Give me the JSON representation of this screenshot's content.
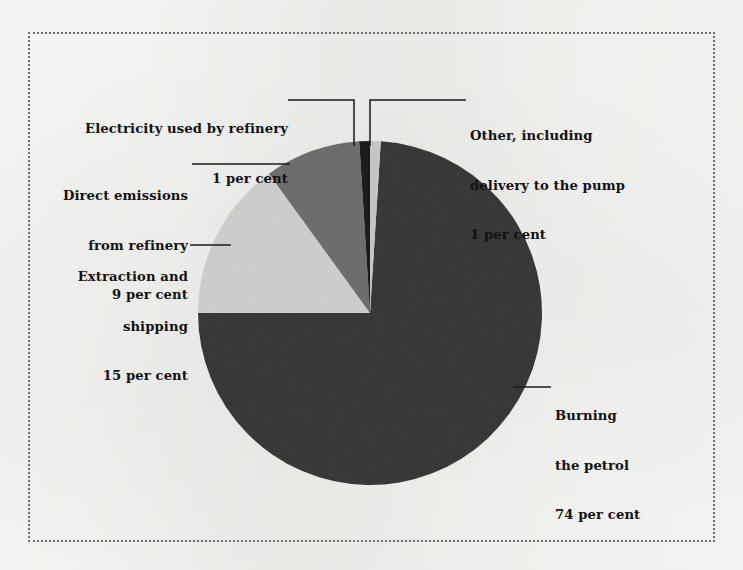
{
  "figure": {
    "frame_style": "dotted-border",
    "background_color": "#f7f7f5"
  },
  "chart_data": {
    "type": "pie",
    "title": "",
    "labels": [
      "Burning the petrol",
      "Extraction and shipping",
      "Direct emissions from refinery",
      "Electricity used by refinery",
      "Other, including delivery to the pump"
    ],
    "values": [
      74,
      15,
      9,
      1,
      1
    ],
    "unit": "per cent",
    "colors": [
      "#3a3a3a",
      "#d0d0d0",
      "#6f6f6f",
      "#1e1e1e",
      "#c8c8c8"
    ],
    "legend": "callout-labels",
    "start_angle_deg": 0,
    "direction": "clockwise",
    "center": [
      370,
      313
    ],
    "radius": 172,
    "slices": [
      {
        "name": "other",
        "label": "Other, including delivery to the pump",
        "value": 1,
        "value_text": "1 per cent",
        "color": "#c8c8c8"
      },
      {
        "name": "burning",
        "label": "Burning the petrol",
        "value": 74,
        "value_text": "74 per cent",
        "color": "#3a3a3a"
      },
      {
        "name": "extraction",
        "label": "Extraction and shipping",
        "value": 15,
        "value_text": "15 per cent",
        "color": "#d0d0d0"
      },
      {
        "name": "direct",
        "label": "Direct emissions from refinery",
        "value": 9,
        "value_text": "9 per cent",
        "color": "#6f6f6f"
      },
      {
        "name": "electricity",
        "label": "Electricity used by refinery",
        "value": 1,
        "value_text": "1 per cent",
        "color": "#1e1e1e"
      }
    ]
  },
  "callouts": {
    "electricity": {
      "line1": "Electricity used by refinery",
      "line2": "1 per cent"
    },
    "direct": {
      "line1": "Direct emissions",
      "line2": "from refinery",
      "line3": "9 per cent"
    },
    "extraction": {
      "line1": "Extraction and",
      "line2": "shipping",
      "line3": "15 per cent"
    },
    "other": {
      "line1": "Other, including",
      "line2": "delivery to the pump",
      "line3": "1 per cent"
    },
    "burning": {
      "line1": "Burning",
      "line2": "the petrol",
      "line3": "74 per cent"
    }
  }
}
